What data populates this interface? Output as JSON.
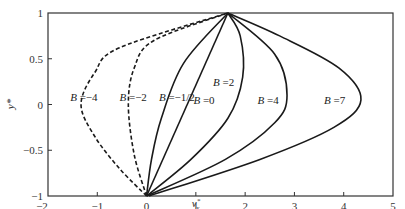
{
  "chart_data": {
    "type": "line",
    "title": "",
    "xlabel": "v_x*",
    "ylabel": "y*",
    "xlim": [
      -2,
      5
    ],
    "ylim": [
      -1,
      1
    ],
    "grid": false,
    "legend": "inline labels",
    "x_ticks": [
      -2,
      -1,
      0,
      1,
      2,
      3,
      4,
      5
    ],
    "x_tick_labels": [
      "−2",
      "−1",
      "0",
      "1",
      "2",
      "3",
      "4",
      "5"
    ],
    "y_ticks": [
      -1,
      -0.5,
      0,
      0.5,
      1
    ],
    "y_tick_labels": [
      "−1",
      "−0.5",
      "0",
      "0.5",
      "1"
    ],
    "series": [
      {
        "name": "B = −4",
        "label": "B =−4",
        "style": "dashed",
        "B": -4,
        "label_pos": [
          -1.55,
          0.08
        ],
        "x": [
          0,
          -0.55,
          -1.05,
          -1.33,
          -1.05,
          -0.55,
          1.65
        ],
        "y": [
          -1,
          -0.7,
          -0.35,
          0,
          0.35,
          0.62,
          1
        ]
      },
      {
        "name": "B = −2",
        "label": "B =−2",
        "style": "dashed",
        "B": -2,
        "label_pos": [
          -0.55,
          0.08
        ],
        "x": [
          0,
          -0.25,
          -0.37,
          -0.25,
          0.15,
          1.65
        ],
        "y": [
          -1,
          -0.55,
          0,
          0.4,
          0.7,
          1
        ]
      },
      {
        "name": "B = −1/2",
        "label": "B =−1/2",
        "style": "solid",
        "B": -0.5,
        "label_pos": [
          0.25,
          0.08
        ],
        "x": [
          0,
          0.1,
          0.3,
          0.75,
          1.65
        ],
        "y": [
          -1,
          -0.6,
          -0.15,
          0.45,
          1
        ]
      },
      {
        "name": "B = 0",
        "label": "B =0",
        "style": "solid",
        "B": 0,
        "label_pos": [
          0.95,
          0.05
        ],
        "x": [
          0,
          1.65
        ],
        "y": [
          -1,
          1
        ]
      },
      {
        "name": "B = 2",
        "label": "B =2",
        "style": "solid",
        "B": 2,
        "label_pos": [
          1.35,
          0.25
        ],
        "x": [
          0,
          0.9,
          1.65,
          1.95,
          1.9,
          1.65
        ],
        "y": [
          -1,
          -0.6,
          -0.15,
          0.3,
          0.75,
          1
        ]
      },
      {
        "name": "B = 4",
        "label": "B =4",
        "style": "solid",
        "B": 4,
        "label_pos": [
          2.25,
          0.05
        ],
        "x": [
          0,
          1.6,
          2.6,
          2.85,
          2.6,
          1.65
        ],
        "y": [
          -1,
          -0.6,
          -0.2,
          0.1,
          0.55,
          1
        ]
      },
      {
        "name": "B = 7",
        "label": "B =7",
        "style": "solid",
        "B": 7,
        "label_pos": [
          3.6,
          0.05
        ],
        "x": [
          0.05,
          2.3,
          3.8,
          4.35,
          3.9,
          2.7,
          1.65
        ],
        "y": [
          -1,
          -0.6,
          -0.25,
          0.05,
          0.4,
          0.75,
          1
        ]
      }
    ]
  },
  "labels": {
    "xlabel": "v",
    "xlabel_sup": "*",
    "xlabel_sub": "x",
    "ylabel": "y*"
  }
}
